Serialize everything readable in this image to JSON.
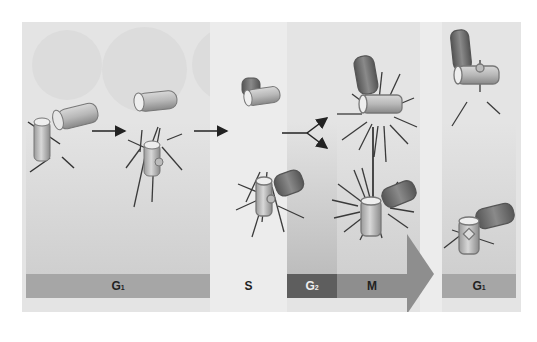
{
  "diagram": {
    "colors": {
      "panel_bg": "#e4e4e4",
      "g1_bar": "#a6a6a6",
      "s_band": "#ececec",
      "g2_bar": "#5e5e5e",
      "m_bar": "#8e8e8e",
      "arrow": "#8e8e8e",
      "centriole_light": "#c9c9c9",
      "centriole_dark": "#6f6f6f",
      "microtubule": "#3a3a3a"
    },
    "phases": [
      {
        "id": "g1",
        "letter": "G",
        "sub": "1"
      },
      {
        "id": "s",
        "letter": "S",
        "sub": ""
      },
      {
        "id": "g2",
        "letter": "G",
        "sub": "2"
      },
      {
        "id": "m",
        "letter": "M",
        "sub": ""
      },
      {
        "id": "g1b",
        "letter": "G",
        "sub": "1"
      }
    ],
    "stages": [
      {
        "id": "stage-1",
        "desc": "paired centrioles (G1)"
      },
      {
        "id": "stage-2",
        "desc": "centrioles separated"
      },
      {
        "id": "stage-3",
        "desc": "daughter centrioles budding (S)"
      },
      {
        "id": "stage-4",
        "desc": "two centrosomes with asters (M)"
      },
      {
        "id": "stage-5",
        "desc": "daughter cells each with centriole pair (G1)"
      }
    ]
  }
}
